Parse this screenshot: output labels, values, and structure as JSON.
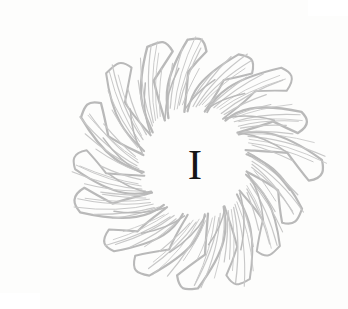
{
  "page": {
    "background_color": "#fdfdfc",
    "width": 308,
    "height": 293
  },
  "ornament": {
    "name": "sunburst-flame-medallion",
    "style": "engraved line art",
    "stroke_color": "#b9b9b9",
    "hatch_color": "#c8c8c8",
    "center_x": 155,
    "center_y": 147,
    "outer_radius": 133,
    "inner_clear_radius": 55,
    "petal_count": 16,
    "swirl_direction": "counterclockwise",
    "hatch_lines_per_petal": 6
  },
  "dropcap": {
    "letter": "I",
    "color": "#151515",
    "center_x": 155,
    "center_y": 148,
    "width": 19,
    "height": 28,
    "typeface_style": "serif-slab"
  }
}
